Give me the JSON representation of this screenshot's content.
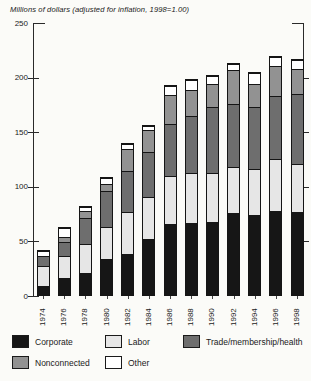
{
  "chart_data": {
    "type": "bar",
    "stacked": true,
    "title": "Millions of dollars (adjusted for inflation, 1998=1.00)",
    "xlabel": "",
    "ylabel": "",
    "ylim": [
      0,
      250
    ],
    "yticks": [
      0,
      50,
      100,
      150,
      200,
      250
    ],
    "grid": false,
    "legend_position": "bottom",
    "categories": [
      "1974",
      "1976",
      "1978",
      "1980",
      "1982",
      "1984",
      "1986",
      "1988",
      "1990",
      "1992",
      "1994",
      "1996",
      "1998"
    ],
    "series": [
      {
        "name": "Corporate",
        "color": "#161616",
        "values": [
          8,
          16,
          20,
          33,
          38,
          51,
          65,
          66,
          67,
          75,
          73,
          77,
          76
        ]
      },
      {
        "name": "Labor",
        "color": "#e6e6e6",
        "values": [
          19,
          20,
          27,
          29,
          38,
          39,
          44,
          46,
          45,
          42,
          42,
          48,
          44
        ]
      },
      {
        "name": "Trade/membership/health",
        "color": "#6e6e6e",
        "values": [
          9,
          13,
          24,
          33,
          38,
          41,
          48,
          52,
          60,
          58,
          57,
          57,
          64
        ]
      },
      {
        "name": "Nonconnected",
        "color": "#929292",
        "values": [
          0,
          4,
          6,
          7,
          20,
          20,
          26,
          24,
          21,
          31,
          21,
          28,
          23
        ]
      },
      {
        "name": "Other",
        "color": "#ffffff",
        "values": [
          4,
          8,
          4,
          5,
          4,
          4,
          8,
          9,
          8,
          6,
          10,
          8,
          8
        ]
      }
    ],
    "stack_order_bottom_to_top": [
      "Corporate",
      "Labor",
      "Trade/membership/health",
      "Nonconnected",
      "Other"
    ],
    "totals": [
      40,
      61,
      81,
      107,
      138,
      155,
      191,
      197,
      201,
      212,
      203,
      218,
      215
    ],
    "legend_columns": [
      [
        "Corporate",
        "Nonconnected"
      ],
      [
        "Labor",
        "Other"
      ],
      [
        "Trade/membership/health"
      ]
    ]
  }
}
